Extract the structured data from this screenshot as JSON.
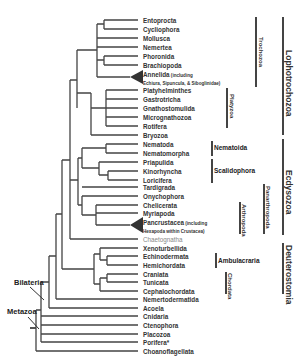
{
  "diagram": {
    "type": "phylogenetic-tree",
    "leaves": [
      {
        "label": "Entoprocta",
        "y": 20
      },
      {
        "label": "Cycliophora",
        "y": 29
      },
      {
        "label": "Mollusca",
        "y": 38
      },
      {
        "label": "Nemertea",
        "y": 47
      },
      {
        "label": "Phoronida",
        "y": 56
      },
      {
        "label": "Brachiopoda",
        "y": 65
      },
      {
        "label": "Annelida",
        "sub1": " (including",
        "sub2": "Echiura, Sipuncula, & Siboglinidae)",
        "y": 77,
        "collapsed": true
      },
      {
        "label": "Platyhelminthes",
        "y": 90
      },
      {
        "label": "Gastrotricha",
        "y": 99
      },
      {
        "label": "Gnathostomulida",
        "y": 108
      },
      {
        "label": "Micrognathozoa",
        "y": 117
      },
      {
        "label": "Rotifera",
        "y": 126
      },
      {
        "label": "Bryozoa",
        "y": 135
      },
      {
        "label": "Nematoda",
        "y": 144
      },
      {
        "label": "Nematomorpha",
        "y": 153
      },
      {
        "label": "Priapulida",
        "y": 162
      },
      {
        "label": "Kinorhyncha",
        "y": 171
      },
      {
        "label": "Loricifera",
        "y": 180
      },
      {
        "label": "Tardigrada",
        "y": 187
      },
      {
        "label": "Onychophora",
        "y": 196
      },
      {
        "label": "Chelicerata",
        "y": 205
      },
      {
        "label": "Myriapoda",
        "y": 213
      },
      {
        "label": "Pancrustacea",
        "sub1": " (including",
        "sub2": "Hexapoda within Crustacea)",
        "y": 225,
        "collapsed": true
      },
      {
        "label": "Chaetognatha",
        "y": 239,
        "light": true
      },
      {
        "label": "Xenoturbellida",
        "y": 248
      },
      {
        "label": "Echinodermata",
        "y": 256
      },
      {
        "label": "Hemichordata",
        "y": 265
      },
      {
        "label": "Craniata",
        "y": 274
      },
      {
        "label": "Tunicata",
        "y": 282
      },
      {
        "label": "Cephalochordata",
        "y": 291
      },
      {
        "label": "Nemertodermatida",
        "y": 299
      },
      {
        "label": "Acoela",
        "y": 308
      },
      {
        "label": "Cnidaria",
        "y": 316
      },
      {
        "label": "Ctenophora",
        "y": 325
      },
      {
        "label": "Placozoa",
        "y": 334
      },
      {
        "label": "Porifera*",
        "y": 342
      },
      {
        "label": "Choanoflagellata",
        "y": 351
      }
    ],
    "node_labels": {
      "bilateria": "Bilateria",
      "metazoa": "Metazoa"
    },
    "small_groups": {
      "trochozoa": "Trochozoa",
      "platyzoa": "Platyzoa",
      "nematoida": "Nematoida",
      "scalidophora": "Scalidophora",
      "panarthropoda": "Panarthropoda",
      "arthropoda": "Arthropoda",
      "ambulacraria": "Ambulacraria",
      "chordata": "Chordata"
    },
    "major_groups": {
      "lophotrochozoa": "Lophotrochozoa",
      "ecdysozoa": "Ecdysozoa",
      "deuterostomia": "Deuterostomia"
    },
    "colors": {
      "line": "#444444",
      "text": "#333333",
      "light_text": "#888888"
    }
  }
}
